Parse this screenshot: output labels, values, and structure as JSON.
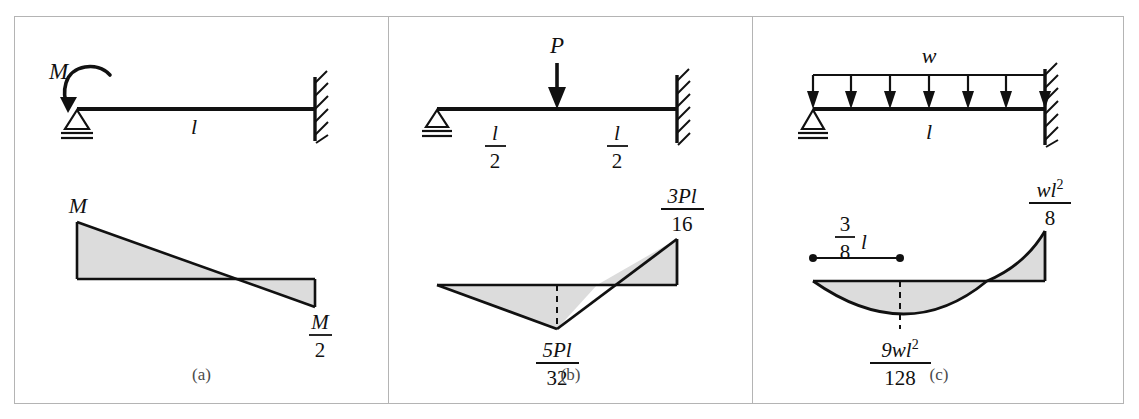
{
  "figure": {
    "background": "#ffffff",
    "frame_color": "#b4b4b4",
    "fill_color": "#dcdcdc",
    "line_color": "#111111"
  },
  "panels": [
    {
      "id": "a",
      "caption": "(a)",
      "beam": {
        "load_label": "M",
        "load_type": "applied-moment",
        "span_label": "l",
        "left_support": "pin",
        "right_support": "fixed-wall"
      },
      "moment_diagram": {
        "left_label": "M",
        "right_label_num": "M",
        "right_label_den": "2",
        "shape": "linear",
        "zero_crossing_fraction": 0.67,
        "left_value": 1.0,
        "right_value": -0.5
      }
    },
    {
      "id": "b",
      "caption": "(b)",
      "beam": {
        "load_label": "P",
        "load_type": "point-load",
        "left_span_num": "l",
        "left_span_den": "2",
        "right_span_num": "l",
        "right_span_den": "2",
        "left_support": "pin",
        "right_support": "fixed-wall"
      },
      "moment_diagram": {
        "mid_label_num": "5Pl",
        "mid_label_den": "32",
        "end_label_num": "3Pl",
        "end_label_den": "16",
        "shape": "linear",
        "mid_value": -0.833,
        "end_value": 1.0,
        "zero_crossing_fraction": 0.67
      }
    },
    {
      "id": "c",
      "caption": "(c)",
      "beam": {
        "load_label": "w",
        "load_type": "uniform-distributed",
        "arrow_count": 7,
        "span_label": "l",
        "left_support": "pin",
        "right_support": "fixed-wall"
      },
      "moment_diagram": {
        "dim_label_num": "3",
        "dim_label_den": "8",
        "dim_label_suffix": "l",
        "max_label_num": "9wl",
        "max_label_num_sup": "2",
        "max_label_den": "128",
        "end_label_num": "wl",
        "end_label_num_sup": "2",
        "end_label_den": "8",
        "shape": "parabolic",
        "min_value": -0.5625,
        "min_position_fraction": 0.375,
        "end_value": 1.0,
        "zero_crossing_fraction": 0.75
      }
    }
  ]
}
